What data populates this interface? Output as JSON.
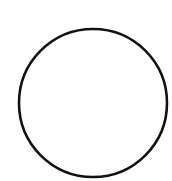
{
  "diagram": {
    "shapes": [
      {
        "type": "circle",
        "cx": 93,
        "cy": 103,
        "r": 74,
        "stroke": "#111111",
        "stroke_width": 2.6,
        "fill": "none"
      }
    ],
    "background": "#ffffff"
  }
}
